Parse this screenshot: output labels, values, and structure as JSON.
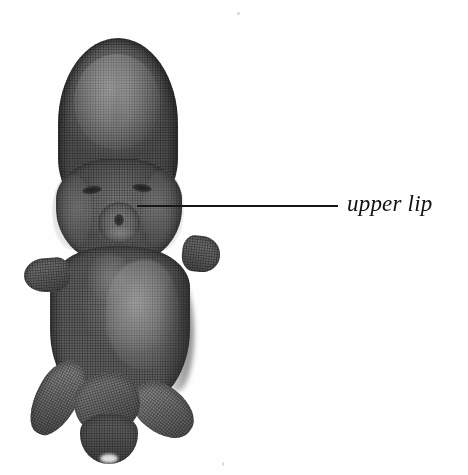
{
  "figure": {
    "type": "anatomical-photograph",
    "background_color": "#fefefe",
    "annotations": [
      {
        "id": "upper-lip",
        "label": "upper lip",
        "style": "italic-serif",
        "text_color": "#121212",
        "leader_line": {
          "color": "#161616",
          "x_start": 137,
          "x_end": 338,
          "y": 206,
          "thickness": 2
        },
        "points_to": "upper lip of the specimen"
      }
    ],
    "specimen": {
      "tone_range": {
        "highlight": "#b0b0b0",
        "midtone": "#7c7c7c",
        "shadow": "#454545",
        "darkest": "#1e1e1e"
      },
      "texture": "halftone-dot",
      "parts": [
        {
          "name": "head",
          "description": "large rounded cranial dome"
        },
        {
          "name": "face-block",
          "description": "maxillary and cheek region"
        },
        {
          "name": "eye-left",
          "description": "dark transverse eye slit"
        },
        {
          "name": "eye-right",
          "description": "dark transverse eye slit"
        },
        {
          "name": "snout",
          "description": "nasal prominence rosette"
        },
        {
          "name": "nostril",
          "description": "dark nostril pit"
        },
        {
          "name": "upper-lip",
          "description": "upper lip, annotated structure"
        },
        {
          "name": "trunk",
          "description": "main body mass"
        },
        {
          "name": "ventral-patch",
          "description": "pale abdominal wall bulge"
        },
        {
          "name": "forelimb-left",
          "description": "left forelimb bud"
        },
        {
          "name": "forelimb-right",
          "description": "right forelimb bud"
        },
        {
          "name": "hindlimb-left",
          "description": "left hindlimb paddle"
        },
        {
          "name": "hindlimb-right",
          "description": "right hindlimb paddle"
        },
        {
          "name": "tail",
          "description": "tail curling between hind limbs"
        }
      ]
    }
  }
}
